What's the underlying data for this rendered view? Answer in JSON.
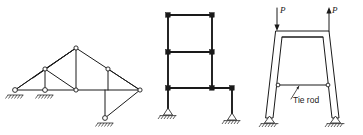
{
  "figure": {
    "background_color": "#ffffff",
    "line_color": "#1a1a1a",
    "width": 363,
    "height": 135
  },
  "panels": [
    {
      "id": "panel-a",
      "name": "roof-truss-diagram",
      "description": "Planar pin-jointed roof truss with inclined top chord, horizontal bottom chord, web members and an inclined prop to a lower roller support",
      "joint_style": "pin",
      "supports": [
        {
          "type": "roller",
          "position": "left-bottom-chord-end"
        },
        {
          "type": "roller",
          "position": "second-bottom-chord-node"
        },
        {
          "type": "roller",
          "position": "base-of-inclined-prop"
        }
      ]
    },
    {
      "id": "panel-b",
      "name": "two-story-rigid-frame-diagram",
      "description": "Two-bay rigid frame: two-story left portion with stepped right column down to foundation",
      "joint_style": "rigid",
      "supports": [
        {
          "type": "pin",
          "position": "left-column-base"
        },
        {
          "type": "pin",
          "position": "right-column-base"
        }
      ]
    },
    {
      "id": "panel-c",
      "name": "tapered-portal-frame-with-tie-rod",
      "description": "Trapezoidal portal frame with inclined legs, double-line members, horizontal tie rod and two applied loads",
      "joint_style": "pin",
      "supports": [
        {
          "type": "pin",
          "position": "left-leg-base"
        },
        {
          "type": "pin",
          "position": "right-leg-base"
        }
      ],
      "annotations": [
        {
          "name": "tie-rod-label",
          "text": "Tie rod",
          "leader": true
        }
      ],
      "loads": [
        {
          "name": "load-left",
          "label": "P",
          "direction": "down"
        },
        {
          "name": "load-right",
          "label": "P",
          "direction": "up"
        }
      ]
    }
  ],
  "labels": {
    "tie_rod": "Tie rod",
    "load_p_left": "P",
    "load_p_right": "P"
  }
}
